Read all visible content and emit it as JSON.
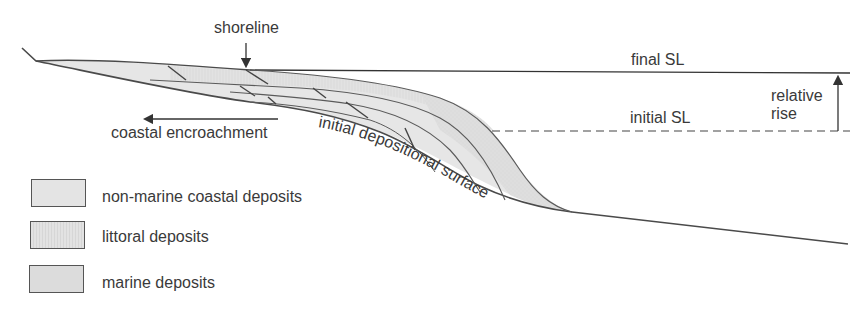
{
  "diagram": {
    "labels": {
      "shoreline": "shoreline",
      "final_sl": "final SL",
      "initial_sl": "initial SL",
      "relative_rise_line1": "relative",
      "relative_rise_line2": "rise",
      "coastal_encroachment": "coastal encroachment",
      "initial_depositional_surface": "initial depositional surface"
    },
    "legend": [
      {
        "label": "non-marine coastal deposits",
        "fill": "#e4e4e4"
      },
      {
        "label": "littoral deposits",
        "fill": "#dadada"
      },
      {
        "label": "marine deposits",
        "fill": "#dcdcdc"
      }
    ],
    "colors": {
      "line": "#4a4a4a",
      "fill_light": "#e6e6e6",
      "fill_mid": "#dcdcdc"
    }
  }
}
